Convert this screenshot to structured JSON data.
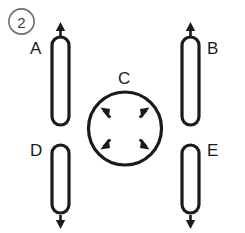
{
  "figure": {
    "number_badge": "2",
    "background_color": "#ffffff",
    "stroke_color": "#1a1a1a",
    "badge_stroke_color": "#6e6e6e",
    "canvas": {
      "width": 245,
      "height": 233
    }
  },
  "diagram": {
    "type": "physics-force-diagram",
    "objects": [
      {
        "id": "A",
        "label": "A",
        "shape": "capsule",
        "label_position": "left",
        "arrow": {
          "name": "up-arrow",
          "direction": "up",
          "position": "top",
          "glyph": "↑"
        },
        "geometry": {
          "x": 52,
          "y": 37,
          "width": 17,
          "height": 88,
          "cx": 60.5
        },
        "label_xy": {
          "x": 30,
          "y": 50
        },
        "arrow_span": {
          "from_y": 36,
          "to_y": 24
        }
      },
      {
        "id": "B",
        "label": "B",
        "shape": "capsule",
        "label_position": "right",
        "arrow": {
          "name": "up-arrow",
          "direction": "up",
          "position": "top",
          "glyph": "↑"
        },
        "geometry": {
          "x": 182,
          "y": 37,
          "width": 17,
          "height": 88,
          "cx": 190.5
        },
        "label_xy": {
          "x": 207,
          "y": 50
        },
        "arrow_span": {
          "from_y": 36,
          "to_y": 24
        }
      },
      {
        "id": "C",
        "label": "C",
        "shape": "circle",
        "label_position": "top",
        "arrow": {
          "name": "radial-outward-arrows",
          "direction": "outward-diagonal",
          "position": "inside",
          "count": 4,
          "glyph": "↖↗↙↘"
        },
        "geometry": {
          "cx": 125,
          "cy": 128.5,
          "r": 36.5
        },
        "label_xy": {
          "x": 118,
          "y": 80
        },
        "inner_arrows": [
          {
            "name": "arrow-northwest",
            "angle_deg": 225,
            "glyph": "↖"
          },
          {
            "name": "arrow-northeast",
            "angle_deg": 315,
            "glyph": "↗"
          },
          {
            "name": "arrow-southwest",
            "angle_deg": 135,
            "glyph": "↙"
          },
          {
            "name": "arrow-southeast",
            "angle_deg": 45,
            "glyph": "↘"
          }
        ]
      },
      {
        "id": "D",
        "label": "D",
        "shape": "capsule",
        "label_position": "left",
        "arrow": {
          "name": "down-arrow",
          "direction": "down",
          "position": "bottom",
          "glyph": "↓"
        },
        "geometry": {
          "x": 52,
          "y": 145,
          "width": 17,
          "height": 68,
          "cx": 60.5
        },
        "label_xy": {
          "x": 30,
          "y": 152
        },
        "arrow_span": {
          "from_y": 214,
          "to_y": 228
        }
      },
      {
        "id": "E",
        "label": "E",
        "shape": "capsule",
        "label_position": "right",
        "arrow": {
          "name": "down-arrow",
          "direction": "down",
          "position": "bottom",
          "glyph": "↓"
        },
        "geometry": {
          "x": 182,
          "y": 145,
          "width": 17,
          "height": 68,
          "cx": 190.5
        },
        "label_xy": {
          "x": 207,
          "y": 152
        },
        "arrow_span": {
          "from_y": 214,
          "to_y": 228
        }
      }
    ]
  }
}
